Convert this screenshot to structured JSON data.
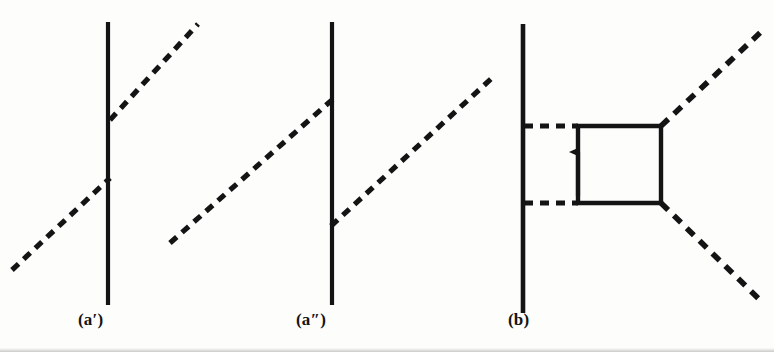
{
  "figure": {
    "background_color": "#fdfdfc",
    "ink_color": "#141414",
    "width": 774,
    "height": 352,
    "panels": [
      {
        "id": "a-prime",
        "label": "(a′)",
        "description": "Single solid vertical fermion line crossed by two dashed boson lines attached at two separate vertices",
        "label_x": 78,
        "label_y": 310
      },
      {
        "id": "a-double-prime",
        "label": "(a″)",
        "description": "Single solid vertical fermion line with a dashed boson line entering from lower-left at the upper vertex and a dashed boson line leaving to the upper-right at the lower vertex",
        "label_x": 296,
        "label_y": 310
      },
      {
        "id": "b",
        "label": "(b)",
        "description": "Box diagram: solid vertical fermion line on the left, a square solid loop with an upward arrow on its left edge, two horizontal dashed lines joining the fermion line to the box, and two dashed boson lines radiating to the upper-right and lower-right",
        "label_x": 508,
        "label_y": 310
      }
    ],
    "geometry": {
      "solid_line_width": 4.2,
      "dashed_line_width": 5.2,
      "dash_pattern": "9 7",
      "panel_a_prime": {
        "fermion_line": {
          "x": 108,
          "y1": 22,
          "y2": 305
        },
        "boson_upper": {
          "x1": 110,
          "y1": 120,
          "x2": 198,
          "y2": 24
        },
        "boson_lower": {
          "x1": 12,
          "y1": 270,
          "x2": 110,
          "y2": 178
        }
      },
      "panel_a_double_prime": {
        "fermion_line": {
          "x": 332,
          "y1": 22,
          "y2": 305
        },
        "boson_upper": {
          "x1": 170,
          "y1": 243,
          "x2": 333,
          "y2": 99
        },
        "boson_lower": {
          "x1": 331,
          "y1": 226,
          "x2": 492,
          "y2": 78
        }
      },
      "panel_b": {
        "fermion_line": {
          "x": 523,
          "y1": 24,
          "y2": 313
        },
        "box": {
          "left": 578,
          "right": 661,
          "top": 126,
          "bottom": 203
        },
        "arrow": {
          "x": 578,
          "y_tail": 195,
          "y_head": 150,
          "direction": "up"
        },
        "boson_rung_top": {
          "x1": 524,
          "y1": 126,
          "x2": 578,
          "y2": 126
        },
        "boson_rung_bottom": {
          "x1": 524,
          "y1": 203,
          "x2": 578,
          "y2": 203
        },
        "boson_out_upper": {
          "x1": 661,
          "y1": 126,
          "x2": 762,
          "y2": 31
        },
        "boson_out_lower": {
          "x1": 661,
          "y1": 203,
          "x2": 761,
          "y2": 301
        }
      }
    }
  }
}
